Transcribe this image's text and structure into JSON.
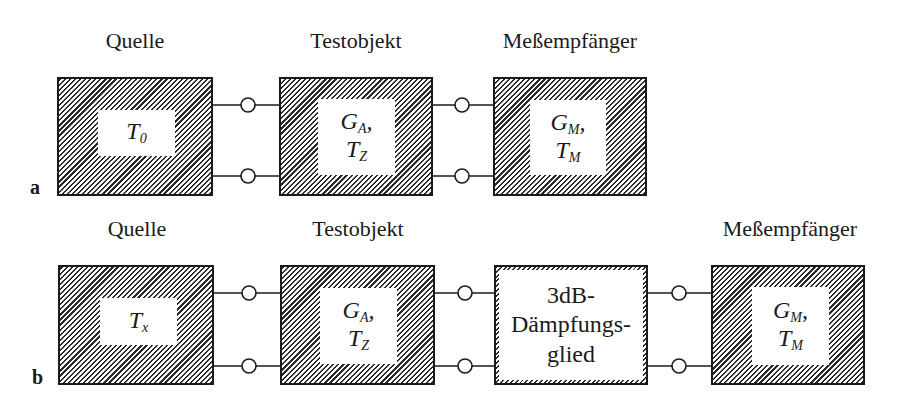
{
  "row_a": {
    "label": "a",
    "blocks": [
      {
        "heading": "Quelle",
        "params": [
          {
            "sym": "T",
            "sub": "0"
          }
        ]
      },
      {
        "heading": "Testobjekt",
        "params": [
          {
            "sym": "G",
            "sub": "A",
            "suffix": ","
          },
          {
            "sym": "T",
            "sub": "Z"
          }
        ]
      },
      {
        "heading": "Meßempfänger",
        "params": [
          {
            "sym": "G",
            "sub": "M",
            "suffix": ","
          },
          {
            "sym": "T",
            "sub": "M"
          }
        ]
      }
    ]
  },
  "row_b": {
    "label": "b",
    "blocks": [
      {
        "heading": "Quelle",
        "params": [
          {
            "sym": "T",
            "sub": "x"
          }
        ]
      },
      {
        "heading": "Testobjekt",
        "params": [
          {
            "sym": "G",
            "sub": "A",
            "suffix": ","
          },
          {
            "sym": "T",
            "sub": "Z"
          }
        ]
      },
      {
        "heading": "",
        "lines": [
          "3dB-",
          "Dämpfungs-",
          "glied"
        ]
      },
      {
        "heading": "Meßempfänger",
        "params": [
          {
            "sym": "G",
            "sub": "M",
            "suffix": ","
          },
          {
            "sym": "T",
            "sub": "M"
          }
        ]
      }
    ]
  },
  "colors": {
    "ink": "#1a1a1a",
    "hatch": "#2a2a2a",
    "background": "#ffffff"
  }
}
